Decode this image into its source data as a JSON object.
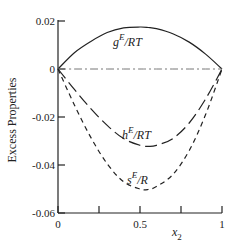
{
  "chart_data": {
    "type": "line",
    "title": "",
    "xlabel": "x2",
    "xlabel_main": "x",
    "xlabel_sub": "2",
    "ylabel": "Excess Properties",
    "xlim": [
      0,
      1
    ],
    "ylim": [
      -0.06,
      0.02
    ],
    "grid": false,
    "x_ticks": [
      0,
      0.25,
      0.5,
      0.75,
      1
    ],
    "x_tick_labels": [
      "0",
      "",
      "0.5",
      "",
      "1"
    ],
    "y_ticks": [
      0.02,
      0,
      -0.02,
      -0.04,
      -0.06
    ],
    "y_tick_labels": [
      "0.02",
      "0",
      "-0.02",
      "-0.04",
      "-0.06"
    ],
    "x": [
      0,
      0.1,
      0.2,
      0.3,
      0.4,
      0.5,
      0.55,
      0.6,
      0.7,
      0.8,
      0.9,
      1.0
    ],
    "series": [
      {
        "name": "gE/RT",
        "label_main": "g",
        "label_sup": "E",
        "label_rest": "/RT",
        "style": "solid",
        "values": [
          0,
          0.0068,
          0.0115,
          0.0152,
          0.0171,
          0.0175,
          0.0173,
          0.0168,
          0.0147,
          0.0112,
          0.0062,
          0
        ]
      },
      {
        "name": "zero line",
        "style": "dashdot",
        "values": [
          0,
          0,
          0,
          0,
          0,
          0,
          0,
          0,
          0,
          0,
          0,
          0
        ]
      },
      {
        "name": "hE/RT",
        "label_main": "h",
        "label_sup": "E",
        "label_rest": "/RT",
        "style": "longdash",
        "values": [
          0,
          -0.0085,
          -0.0165,
          -0.0235,
          -0.029,
          -0.0318,
          -0.0322,
          -0.0318,
          -0.029,
          -0.0225,
          -0.0125,
          0
        ]
      },
      {
        "name": "sE/R",
        "label_main": "s",
        "label_sup": "E",
        "label_rest": "/R",
        "style": "shortdash",
        "values": [
          0,
          -0.015,
          -0.0285,
          -0.0395,
          -0.047,
          -0.05,
          -0.0502,
          -0.049,
          -0.044,
          -0.034,
          -0.019,
          0
        ]
      }
    ]
  }
}
